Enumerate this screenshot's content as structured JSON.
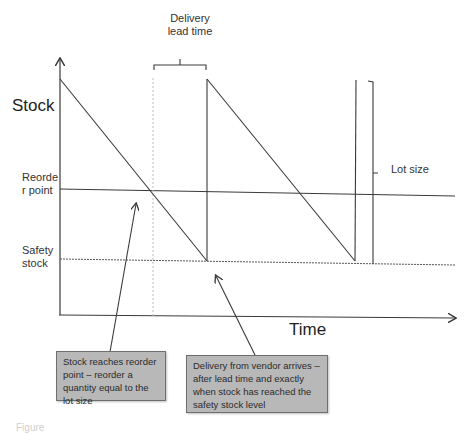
{
  "diagram": {
    "type": "inventory sawtooth (reorder point model)",
    "axes": {
      "y_label": "Stock",
      "x_label": "Time"
    },
    "levels": {
      "reorder_point_label": "Reorde\nr point",
      "safety_stock_label": "Safety\nstock"
    },
    "brackets": {
      "lead_time_label": "Delivery lead time",
      "lot_size_label": "Lot size"
    },
    "callouts": [
      {
        "id": "reorder-callout",
        "text": "Stock reaches reorder point – reorder a quantity equal to the lot size"
      },
      {
        "id": "delivery-callout",
        "text": "Delivery from vendor arrives – after lead time and exactly when stock has reached the safety stock level"
      }
    ],
    "caption": "Figure"
  },
  "colors": {
    "line": "#3a3a3a",
    "guide_dotted": "#bdbdbd",
    "callout_fill": "#b8b8b8",
    "callout_border": "#6e6e6e"
  }
}
